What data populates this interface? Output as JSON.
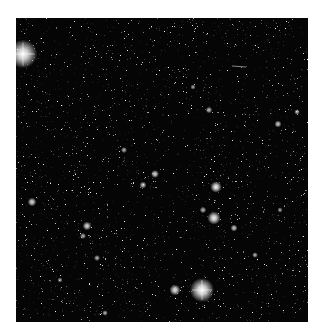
{
  "image": {
    "kind": "astronomical star field",
    "frame": {
      "x": 16,
      "y": 18,
      "width": 292,
      "height": 304
    },
    "background_color": "#050505",
    "page_color": "#ffffff",
    "faint_star_density": 2600,
    "bright_stars": [
      {
        "x": 23,
        "y": 54,
        "r": 6.5,
        "brightness": 1.0
      },
      {
        "x": 202,
        "y": 290,
        "r": 5.5,
        "brightness": 1.0
      },
      {
        "x": 175,
        "y": 290,
        "r": 2.5,
        "brightness": 0.9
      },
      {
        "x": 216,
        "y": 187,
        "r": 2.6,
        "brightness": 0.95
      },
      {
        "x": 214,
        "y": 218,
        "r": 3.0,
        "brightness": 0.95
      },
      {
        "x": 234,
        "y": 228,
        "r": 1.6,
        "brightness": 0.8
      },
      {
        "x": 203,
        "y": 210,
        "r": 1.5,
        "brightness": 0.7
      },
      {
        "x": 32,
        "y": 202,
        "r": 2.0,
        "brightness": 0.85
      },
      {
        "x": 87,
        "y": 226,
        "r": 2.0,
        "brightness": 0.85
      },
      {
        "x": 83,
        "y": 236,
        "r": 1.4,
        "brightness": 0.7
      },
      {
        "x": 97,
        "y": 258,
        "r": 1.4,
        "brightness": 0.7
      },
      {
        "x": 143,
        "y": 185,
        "r": 1.6,
        "brightness": 0.8
      },
      {
        "x": 155,
        "y": 174,
        "r": 1.8,
        "brightness": 0.85
      },
      {
        "x": 209,
        "y": 110,
        "r": 1.5,
        "brightness": 0.75
      },
      {
        "x": 278,
        "y": 124,
        "r": 1.6,
        "brightness": 0.8
      },
      {
        "x": 297,
        "y": 112,
        "r": 1.3,
        "brightness": 0.7
      },
      {
        "x": 193,
        "y": 87,
        "r": 1.2,
        "brightness": 0.65
      },
      {
        "x": 124,
        "y": 150,
        "r": 1.4,
        "brightness": 0.7
      },
      {
        "x": 60,
        "y": 280,
        "r": 1.2,
        "brightness": 0.65
      },
      {
        "x": 105,
        "y": 313,
        "r": 1.3,
        "brightness": 0.7
      },
      {
        "x": 255,
        "y": 255,
        "r": 1.3,
        "brightness": 0.7
      },
      {
        "x": 280,
        "y": 210,
        "r": 1.2,
        "brightness": 0.65
      }
    ],
    "streaks": [
      {
        "x1": 232,
        "y1": 66,
        "x2": 246,
        "y2": 67,
        "alpha": 0.6
      }
    ]
  }
}
